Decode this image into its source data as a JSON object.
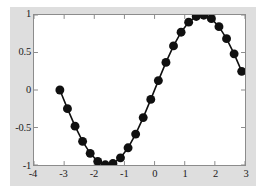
{
  "figure": {
    "background_color": "#dedede",
    "axes_background_color": "#ffffff",
    "axes_border_color": "#8c8c8c",
    "line_color": "#101010",
    "marker_color": "#101010"
  },
  "chart_data": {
    "type": "line",
    "title": "",
    "subtitle": "",
    "xlabel": "",
    "ylabel": "",
    "xlim": [
      -4,
      3
    ],
    "ylim": [
      -1,
      1
    ],
    "xticks": [
      -4,
      -3,
      -2,
      -1,
      0,
      1,
      2,
      3
    ],
    "xticklabels": [
      "-4",
      "-3",
      "-2",
      "-1",
      "0",
      "1",
      "2",
      "3"
    ],
    "yticks": [
      -1,
      -0.5,
      0,
      0.5,
      1
    ],
    "yticklabels": [
      "-1",
      "-0.5",
      "0",
      "0.5",
      "1"
    ],
    "grid": false,
    "legend": null,
    "marker": "filled-circle",
    "marker_size": 6,
    "series": [
      {
        "name": "sin(x)",
        "x": [
          -3.1416,
          -2.8903,
          -2.6389,
          -2.3876,
          -2.1363,
          -1.885,
          -1.6336,
          -1.3823,
          -1.131,
          -0.8796,
          -0.6283,
          -0.377,
          -0.1257,
          0.1257,
          0.377,
          0.6283,
          0.8796,
          1.131,
          1.3823,
          1.6336,
          1.885,
          2.1363,
          2.3876,
          2.6389,
          2.8903
        ],
        "y": [
          0.0,
          -0.2487,
          -0.4818,
          -0.6845,
          -0.8443,
          -0.9511,
          -0.9972,
          -0.9808,
          -0.9048,
          -0.7705,
          -0.5878,
          -0.3681,
          -0.1253,
          0.1253,
          0.3681,
          0.5878,
          0.7705,
          0.9048,
          0.9808,
          0.9972,
          0.9511,
          0.8443,
          0.6845,
          0.4818,
          0.2487
        ]
      }
    ]
  }
}
